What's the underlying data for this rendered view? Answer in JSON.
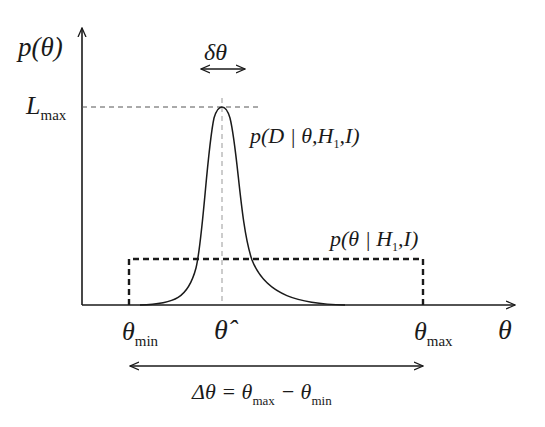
{
  "figure": {
    "y_axis_label": "p(θ)",
    "x_axis_label": "θ",
    "peak_width_label": "δθ",
    "lmax_label": {
      "main": "L",
      "sub": "max"
    },
    "likelihood_label": {
      "pre": "p(D | θ,H",
      "sub": "1",
      "post": ",I)"
    },
    "prior_label": {
      "pre": "p(θ | H",
      "sub": "1",
      "post": ",I)"
    },
    "theta_min_label": {
      "main": "θ",
      "sub": "min"
    },
    "theta_hat_label": "θ̂",
    "theta_max_label": {
      "main": "θ",
      "sub": "max"
    },
    "range_label": {
      "delta": "Δθ = θ",
      "sub1": "max",
      "minus": " − θ",
      "sub2": "min"
    }
  },
  "colors": {
    "ink": "#1a1a1a",
    "guide": "#777777",
    "background": "#ffffff"
  }
}
